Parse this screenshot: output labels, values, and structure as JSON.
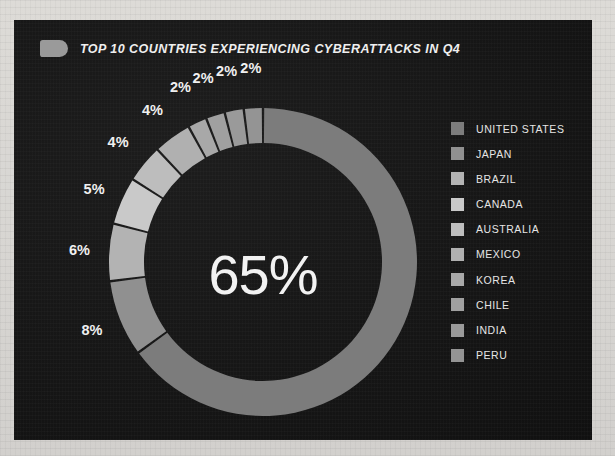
{
  "panel": {
    "background_color": "#161616",
    "page_background_color": "#d8d7d4"
  },
  "header": {
    "tag_icon": "bookmark-tag-icon",
    "title": "TOP 10 COUNTRIES EXPERIENCING CYBERATTACKS IN Q4"
  },
  "donut": {
    "center_value": "65%"
  },
  "legend": {
    "items": [
      {
        "label": "UNITED STATES",
        "color": "#7c7c7c"
      },
      {
        "label": "JAPAN",
        "color": "#909090"
      },
      {
        "label": "BRAZIL",
        "color": "#b3b3b3"
      },
      {
        "label": "CANADA",
        "color": "#c9c9c9"
      },
      {
        "label": "AUSTRALIA",
        "color": "#bdbdbd"
      },
      {
        "label": "MEXICO",
        "color": "#b0b0b0"
      },
      {
        "label": "KOREA",
        "color": "#a8a8a8"
      },
      {
        "label": "CHILE",
        "color": "#a0a0a0"
      },
      {
        "label": "INDIA",
        "color": "#9a9a9a"
      },
      {
        "label": "PERU",
        "color": "#949494"
      }
    ]
  },
  "chart_data": {
    "type": "pie",
    "title": "TOP 10 COUNTRIES EXPERIENCING CYBERATTACKS IN Q4",
    "subtype": "donut",
    "center_label": "65%",
    "units": "percent",
    "total": 100,
    "legend_position": "right",
    "grid": false,
    "categories": [
      "UNITED STATES",
      "JAPAN",
      "BRAZIL",
      "CANADA",
      "AUSTRALIA",
      "MEXICO",
      "KOREA",
      "CHILE",
      "INDIA",
      "PERU"
    ],
    "values": [
      65,
      8,
      6,
      5,
      4,
      4,
      2,
      2,
      2,
      2
    ],
    "labels": [
      "65%",
      "8%",
      "6%",
      "5%",
      "4%",
      "4%",
      "2%",
      "2%",
      "2%",
      "2%"
    ],
    "colors": [
      "#7c7c7c",
      "#909090",
      "#b3b3b3",
      "#c9c9c9",
      "#bdbdbd",
      "#b0b0b0",
      "#a8a8a8",
      "#a0a0a0",
      "#9a9a9a",
      "#949494"
    ],
    "slices": [
      {
        "name": "UNITED STATES",
        "value": 65,
        "label": "65%",
        "color": "#7c7c7c",
        "label_position": "center"
      },
      {
        "name": "JAPAN",
        "value": 8,
        "label": "8%",
        "color": "#909090",
        "label_position": "outside"
      },
      {
        "name": "BRAZIL",
        "value": 6,
        "label": "6%",
        "color": "#b3b3b3",
        "label_position": "outside"
      },
      {
        "name": "CANADA",
        "value": 5,
        "label": "5%",
        "color": "#c9c9c9",
        "label_position": "outside"
      },
      {
        "name": "AUSTRALIA",
        "value": 4,
        "label": "4%",
        "color": "#bdbdbd",
        "label_position": "outside"
      },
      {
        "name": "MEXICO",
        "value": 4,
        "label": "4%",
        "color": "#b0b0b0",
        "label_position": "outside"
      },
      {
        "name": "KOREA",
        "value": 2,
        "label": "2%",
        "color": "#a8a8a8",
        "label_position": "outside"
      },
      {
        "name": "CHILE",
        "value": 2,
        "label": "2%",
        "color": "#a0a0a0",
        "label_position": "outside"
      },
      {
        "name": "INDIA",
        "value": 2,
        "label": "2%",
        "color": "#9a9a9a",
        "label_position": "outside"
      },
      {
        "name": "PERU",
        "value": 2,
        "label": "2%",
        "color": "#949494",
        "label_position": "outside"
      }
    ],
    "start_angle_deg": 0,
    "direction": "clockwise",
    "inner_radius_ratio": 0.77
  }
}
